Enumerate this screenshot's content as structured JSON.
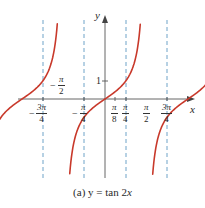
{
  "chart_data": {
    "type": "line",
    "title": "(a) y = tan 2x",
    "function": "y = tan(2x)",
    "xlabel": "x",
    "ylabel": "y",
    "xlim": [
      -2.9,
      2.9
    ],
    "ylim": [
      -4.5,
      4.5
    ],
    "grid": false,
    "legend": null,
    "x_ticks": [
      {
        "value": -2.356,
        "label": "-3π/4",
        "num": "3π",
        "den": "4",
        "sign": "−"
      },
      {
        "value": -1.571,
        "label": "-π/2",
        "num": "π",
        "den": "2",
        "sign": "−",
        "placement": "above"
      },
      {
        "value": -0.785,
        "label": "-π/4",
        "num": "π",
        "den": "4",
        "sign": "−"
      },
      {
        "value": 0.393,
        "label": "π/8",
        "num": "π",
        "den": "8",
        "sign": ""
      },
      {
        "value": 0.785,
        "label": "π/4",
        "num": "π",
        "den": "4",
        "sign": ""
      },
      {
        "value": 1.571,
        "label": "π/2",
        "num": "π",
        "den": "2",
        "sign": ""
      },
      {
        "value": 2.356,
        "label": "3π/4",
        "num": "3π",
        "den": "4",
        "sign": ""
      }
    ],
    "y_ticks": [
      {
        "value": 1,
        "label": "1"
      }
    ],
    "asymptotes": [
      {
        "x": -2.356,
        "label": "x = -3π/4"
      },
      {
        "x": -0.785,
        "label": "x = -π/4"
      },
      {
        "x": 0.785,
        "label": "x = π/4"
      },
      {
        "x": 2.356,
        "label": "x = 3π/4"
      }
    ],
    "branches": [
      {
        "center": -1.571,
        "domain": [
          -2.356,
          -0.785
        ]
      },
      {
        "center": 0,
        "domain": [
          -0.785,
          0.785
        ]
      },
      {
        "center": 1.571,
        "domain": [
          0.785,
          2.356
        ]
      }
    ],
    "sample_points": [
      {
        "x": -1.571,
        "y": 0
      },
      {
        "x": -1.178,
        "y": 1
      },
      {
        "x": -1.963,
        "y": -1
      },
      {
        "x": 0,
        "y": 0
      },
      {
        "x": 0.393,
        "y": 1
      },
      {
        "x": -0.393,
        "y": -1
      },
      {
        "x": 1.571,
        "y": 0
      },
      {
        "x": 1.963,
        "y": 1
      },
      {
        "x": 1.178,
        "y": -1
      }
    ],
    "colors": {
      "curve": "#c8392b",
      "asymptote": "#6fa3c8",
      "axis": "#444444"
    }
  },
  "labels": {
    "x_axis": "x",
    "y_axis": "y",
    "y_tick_1": "1",
    "caption_prefix": "(a) ",
    "caption_eq": "y = tan 2",
    "caption_var": "x",
    "tick_neg_3pi4": {
      "sign": "−",
      "num": "3π",
      "den": "4"
    },
    "tick_neg_pi2": {
      "sign": "−",
      "num": "π",
      "den": "2"
    },
    "tick_neg_pi4": {
      "sign": "−",
      "num": "π",
      "den": "4"
    },
    "tick_pi8": {
      "num": "π",
      "den": "8"
    },
    "tick_pi4": {
      "num": "π",
      "den": "4"
    },
    "tick_pi2": {
      "num": "π",
      "den": "2"
    },
    "tick_3pi4": {
      "num": "3π",
      "den": "4"
    }
  }
}
